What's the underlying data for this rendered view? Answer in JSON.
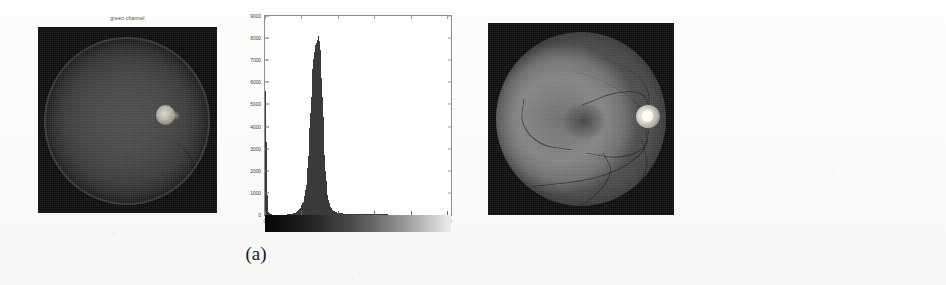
{
  "figure": {
    "panels": [
      {
        "caption": "(a)",
        "image_title": "green channel"
      },
      {
        "caption": "(b)",
        "image_title": ""
      }
    ]
  },
  "panel_a": {
    "caption": "(a)",
    "image_title": "green channel",
    "image_name": "fundus-green-channel"
  },
  "panel_b": {
    "caption": "(b)",
    "image_title": "",
    "image_name": "fundus-enhanced"
  },
  "chart_data": [
    {
      "id": "histogram-a",
      "type": "bar",
      "title": "",
      "xlabel": "",
      "ylabel": "",
      "xlim": [
        0,
        255
      ],
      "ylim": [
        0,
        9000
      ],
      "grid": false,
      "legend": null,
      "xticks": [
        0,
        50,
        100,
        150,
        200,
        250
      ],
      "xtick_labels": [
        "0",
        "50",
        "100",
        "150",
        "200",
        "250"
      ],
      "yticks": [
        0,
        1000,
        2000,
        3000,
        4000,
        5000,
        6000,
        7000,
        8000,
        9000
      ],
      "ytick_labels": [
        "0",
        "1000",
        "2000",
        "3000",
        "4000",
        "5000",
        "6000",
        "7000",
        "8000",
        "9000"
      ],
      "colorbar": true,
      "colorbar_range": [
        "black",
        "white"
      ],
      "notes": "Narrow unimodal peak near intensity 72 plus a tall spike at intensity 0 (background pixels)",
      "x": [
        0,
        2,
        4,
        6,
        8,
        10,
        12,
        14,
        16,
        18,
        20,
        22,
        24,
        26,
        28,
        30,
        32,
        34,
        36,
        38,
        40,
        42,
        44,
        46,
        48,
        50,
        52,
        54,
        56,
        58,
        60,
        62,
        64,
        66,
        68,
        70,
        72,
        74,
        76,
        78,
        80,
        82,
        84,
        86,
        88,
        90,
        92,
        94,
        96,
        98,
        100,
        104,
        108,
        112,
        116,
        120,
        126,
        132,
        138,
        144,
        150,
        160,
        170,
        180,
        190,
        200,
        210,
        220,
        230,
        240,
        250,
        255
      ],
      "values": [
        5600,
        900,
        120,
        40,
        25,
        20,
        18,
        18,
        17,
        17,
        18,
        18,
        19,
        20,
        22,
        25,
        30,
        38,
        50,
        70,
        95,
        130,
        175,
        235,
        320,
        430,
        600,
        900,
        1400,
        2150,
        3200,
        4500,
        5900,
        7000,
        7800,
        8000,
        8300,
        7900,
        6900,
        5200,
        3400,
        2000,
        1150,
        700,
        450,
        300,
        215,
        165,
        130,
        110,
        95,
        75,
        62,
        54,
        48,
        44,
        40,
        36,
        33,
        30,
        28,
        25,
        22,
        20,
        18,
        16,
        14,
        12,
        11,
        10,
        9,
        8
      ]
    },
    {
      "id": "histogram-b",
      "type": "bar",
      "title": "",
      "xlabel": "",
      "ylabel": "",
      "xlim": [
        0,
        255
      ],
      "ylim": [
        0,
        5600
      ],
      "grid": false,
      "legend": null,
      "xticks": [
        0,
        50,
        100,
        150,
        200,
        250
      ],
      "xtick_labels": [
        "0",
        "50",
        "100",
        "150",
        "200",
        "250"
      ],
      "yticks": [
        1000,
        2000,
        3000,
        4000,
        5000
      ],
      "ytick_labels": [
        "1000",
        "2000",
        "3000",
        "4000",
        "5000"
      ],
      "colorbar": true,
      "colorbar_range": [
        "black",
        "white"
      ],
      "notes": "Clipped background spike near intensity 15 exceeding the axis top, plus a broad asymmetric retina peak near intensity 100 with a long right tail",
      "x": [
        0,
        2,
        4,
        6,
        8,
        10,
        12,
        14,
        16,
        18,
        20,
        22,
        24,
        26,
        28,
        30,
        32,
        34,
        36,
        38,
        40,
        44,
        48,
        52,
        56,
        60,
        64,
        68,
        72,
        76,
        80,
        84,
        88,
        92,
        96,
        100,
        104,
        108,
        112,
        116,
        120,
        124,
        128,
        132,
        136,
        140,
        146,
        152,
        158,
        164,
        170,
        178,
        186,
        194,
        202,
        210,
        220,
        230,
        240,
        250,
        255
      ],
      "values": [
        300,
        260,
        240,
        230,
        250,
        700,
        3600,
        5600,
        5600,
        5400,
        3000,
        700,
        260,
        200,
        190,
        200,
        230,
        280,
        360,
        470,
        600,
        820,
        1000,
        1180,
        1380,
        1620,
        1900,
        2250,
        2650,
        3050,
        3450,
        3800,
        4050,
        4180,
        4200,
        4180,
        4000,
        3650,
        3150,
        2600,
        2050,
        1550,
        1150,
        860,
        660,
        520,
        400,
        330,
        290,
        255,
        230,
        200,
        180,
        165,
        150,
        140,
        125,
        112,
        100,
        90,
        85
      ]
    }
  ]
}
